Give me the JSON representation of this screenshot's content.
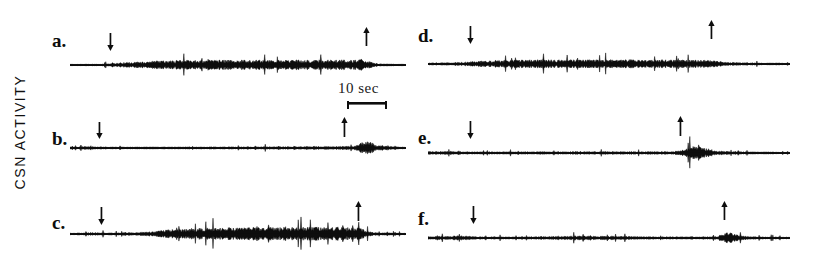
{
  "figure": {
    "axis_label": "CSN ACTIVITY",
    "background_color": "#ffffff",
    "trace_color": "#0d0d0d",
    "width": 817,
    "height": 263
  },
  "scalebar": {
    "label": "10 sec",
    "value": 10,
    "unit": "sec",
    "x": 338,
    "y": 80,
    "bar_x": 345,
    "bar_y": 101,
    "bar_length": 40
  },
  "panels": [
    {
      "id": "a",
      "label": "a.",
      "label_x": 52,
      "label_y": 31,
      "baseline_y": 65,
      "trace_x": 70,
      "trace_width": 336,
      "arrows": [
        {
          "name": "onset",
          "x": 110,
          "y": 33,
          "height": 18,
          "direction": "down"
        },
        {
          "name": "offset",
          "x": 366,
          "y": 27,
          "height": 19,
          "direction": "up"
        }
      ],
      "envelope": [
        {
          "x": 0.0,
          "amp": 1.2
        },
        {
          "x": 0.09,
          "amp": 1.4
        },
        {
          "x": 0.13,
          "amp": 3.0
        },
        {
          "x": 0.22,
          "amp": 6.5
        },
        {
          "x": 0.33,
          "amp": 8.0
        },
        {
          "x": 0.45,
          "amp": 8.5
        },
        {
          "x": 0.58,
          "amp": 8.2
        },
        {
          "x": 0.7,
          "amp": 8.6
        },
        {
          "x": 0.82,
          "amp": 9.0
        },
        {
          "x": 0.87,
          "amp": 9.5
        },
        {
          "x": 0.89,
          "amp": 6.0
        },
        {
          "x": 0.92,
          "amp": 2.0
        },
        {
          "x": 1.0,
          "amp": 1.2
        }
      ]
    },
    {
      "id": "b",
      "label": "b.",
      "label_x": 52,
      "label_y": 129,
      "baseline_y": 148,
      "trace_x": 70,
      "trace_width": 336,
      "arrows": [
        {
          "name": "onset",
          "x": 99,
          "y": 122,
          "height": 17,
          "direction": "down"
        },
        {
          "name": "offset",
          "x": 344,
          "y": 117,
          "height": 20,
          "direction": "up"
        }
      ],
      "envelope": [
        {
          "x": 0.0,
          "amp": 1.6
        },
        {
          "x": 0.06,
          "amp": 2.6
        },
        {
          "x": 0.12,
          "amp": 1.6
        },
        {
          "x": 0.3,
          "amp": 1.8
        },
        {
          "x": 0.5,
          "amp": 2.0
        },
        {
          "x": 0.65,
          "amp": 2.4
        },
        {
          "x": 0.78,
          "amp": 2.8
        },
        {
          "x": 0.85,
          "amp": 3.4
        },
        {
          "x": 0.875,
          "amp": 11.0
        },
        {
          "x": 0.89,
          "amp": 12.0
        },
        {
          "x": 0.91,
          "amp": 5.0
        },
        {
          "x": 0.94,
          "amp": 3.6
        },
        {
          "x": 0.97,
          "amp": 2.0
        },
        {
          "x": 1.0,
          "amp": 1.4
        }
      ]
    },
    {
      "id": "c",
      "label": "c.",
      "label_x": 52,
      "label_y": 213,
      "baseline_y": 234,
      "trace_x": 70,
      "trace_width": 336,
      "arrows": [
        {
          "name": "onset",
          "x": 101,
          "y": 207,
          "height": 18,
          "direction": "down"
        },
        {
          "name": "offset",
          "x": 358,
          "y": 201,
          "height": 20,
          "direction": "up"
        }
      ],
      "envelope": [
        {
          "x": 0.0,
          "amp": 1.4
        },
        {
          "x": 0.07,
          "amp": 2.6
        },
        {
          "x": 0.12,
          "amp": 1.8
        },
        {
          "x": 0.22,
          "amp": 3.0
        },
        {
          "x": 0.3,
          "amp": 7.5
        },
        {
          "x": 0.38,
          "amp": 10.0
        },
        {
          "x": 0.5,
          "amp": 11.0
        },
        {
          "x": 0.62,
          "amp": 11.5
        },
        {
          "x": 0.74,
          "amp": 12.0
        },
        {
          "x": 0.83,
          "amp": 12.5
        },
        {
          "x": 0.865,
          "amp": 10.0
        },
        {
          "x": 0.885,
          "amp": 5.0
        },
        {
          "x": 0.91,
          "amp": 2.4
        },
        {
          "x": 1.0,
          "amp": 1.3
        }
      ]
    },
    {
      "id": "d",
      "label": "d.",
      "label_x": 418,
      "label_y": 26,
      "baseline_y": 64,
      "trace_x": 428,
      "trace_width": 362,
      "arrows": [
        {
          "name": "onset",
          "x": 470,
          "y": 26,
          "height": 18,
          "direction": "down"
        },
        {
          "name": "offset",
          "x": 711,
          "y": 20,
          "height": 19,
          "direction": "up"
        }
      ],
      "envelope": [
        {
          "x": 0.0,
          "amp": 2.0
        },
        {
          "x": 0.06,
          "amp": 2.2
        },
        {
          "x": 0.1,
          "amp": 3.2
        },
        {
          "x": 0.15,
          "amp": 5.5
        },
        {
          "x": 0.24,
          "amp": 7.0
        },
        {
          "x": 0.36,
          "amp": 7.2
        },
        {
          "x": 0.48,
          "amp": 7.5
        },
        {
          "x": 0.6,
          "amp": 7.2
        },
        {
          "x": 0.72,
          "amp": 7.0
        },
        {
          "x": 0.79,
          "amp": 6.0
        },
        {
          "x": 0.83,
          "amp": 3.0
        },
        {
          "x": 0.88,
          "amp": 1.8
        },
        {
          "x": 1.0,
          "amp": 1.4
        }
      ]
    },
    {
      "id": "e",
      "label": "e.",
      "label_x": 418,
      "label_y": 128,
      "baseline_y": 153,
      "trace_x": 428,
      "trace_width": 362,
      "arrows": [
        {
          "name": "onset",
          "x": 470,
          "y": 121,
          "height": 18,
          "direction": "down"
        },
        {
          "name": "offset",
          "x": 680,
          "y": 116,
          "height": 20,
          "direction": "up"
        }
      ],
      "envelope": [
        {
          "x": 0.0,
          "amp": 2.6
        },
        {
          "x": 0.05,
          "amp": 3.0
        },
        {
          "x": 0.12,
          "amp": 2.0
        },
        {
          "x": 0.3,
          "amp": 2.2
        },
        {
          "x": 0.45,
          "amp": 2.6
        },
        {
          "x": 0.6,
          "amp": 2.4
        },
        {
          "x": 0.68,
          "amp": 2.6
        },
        {
          "x": 0.7,
          "amp": 6.0
        },
        {
          "x": 0.725,
          "amp": 11.0
        },
        {
          "x": 0.745,
          "amp": 12.0
        },
        {
          "x": 0.77,
          "amp": 8.0
        },
        {
          "x": 0.8,
          "amp": 3.4
        },
        {
          "x": 0.86,
          "amp": 2.2
        },
        {
          "x": 1.0,
          "amp": 1.4
        }
      ]
    },
    {
      "id": "f",
      "label": "f.",
      "label_x": 418,
      "label_y": 209,
      "baseline_y": 238,
      "trace_x": 428,
      "trace_width": 362,
      "arrows": [
        {
          "name": "onset",
          "x": 473,
          "y": 206,
          "height": 18,
          "direction": "down"
        },
        {
          "name": "offset",
          "x": 724,
          "y": 201,
          "height": 19,
          "direction": "up"
        }
      ],
      "envelope": [
        {
          "x": 0.0,
          "amp": 2.4
        },
        {
          "x": 0.05,
          "amp": 3.0
        },
        {
          "x": 0.09,
          "amp": 4.2
        },
        {
          "x": 0.13,
          "amp": 2.2
        },
        {
          "x": 0.25,
          "amp": 1.8
        },
        {
          "x": 0.35,
          "amp": 3.0
        },
        {
          "x": 0.42,
          "amp": 3.6
        },
        {
          "x": 0.52,
          "amp": 3.0
        },
        {
          "x": 0.62,
          "amp": 2.2
        },
        {
          "x": 0.75,
          "amp": 2.0
        },
        {
          "x": 0.8,
          "amp": 2.6
        },
        {
          "x": 0.815,
          "amp": 8.0
        },
        {
          "x": 0.835,
          "amp": 9.5
        },
        {
          "x": 0.855,
          "amp": 5.0
        },
        {
          "x": 0.89,
          "amp": 2.4
        },
        {
          "x": 1.0,
          "amp": 1.4
        }
      ]
    }
  ]
}
